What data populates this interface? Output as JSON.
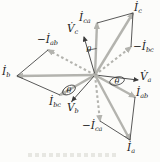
{
  "figure": {
    "type": "phasor-diagram",
    "canvas": {
      "width": 160,
      "height": 162
    },
    "colors": {
      "phasor_gray": "#b3b3ae",
      "construction_black": "#3b3b3b",
      "label_color": "#232323",
      "background": "#fcfcfa"
    },
    "center": [
      95,
      75
    ],
    "phasors": [
      {
        "name": "i-ca",
        "style": "thick",
        "tip": [
          97,
          23
        ]
      },
      {
        "name": "i-c",
        "style": "thick",
        "tip": [
          133,
          13
        ]
      },
      {
        "name": "neg-i-bc",
        "style": "dashed",
        "tip": [
          131,
          47
        ]
      },
      {
        "name": "v-c",
        "style": "thin",
        "tip": [
          84,
          37
        ]
      },
      {
        "name": "neg-i-ab",
        "style": "dashed",
        "tip": [
          48,
          50
        ]
      },
      {
        "name": "i-b",
        "style": "thick",
        "tip": [
          17,
          76
        ]
      },
      {
        "name": "i-bc",
        "style": "thick",
        "tip": [
          60,
          95
        ]
      },
      {
        "name": "v-b",
        "style": "thin",
        "tip": [
          72,
          101
        ]
      },
      {
        "name": "v-a",
        "style": "thin",
        "tip": [
          138,
          80
        ]
      },
      {
        "name": "i-ab",
        "style": "thick",
        "tip": [
          135,
          97
        ]
      },
      {
        "name": "i-a",
        "style": "thick",
        "tip": [
          130,
          140
        ]
      },
      {
        "name": "neg-i-ca",
        "style": "dashed",
        "tip": [
          100,
          121
        ]
      }
    ],
    "construction_lines": [
      {
        "name": "line-ica-to-ic",
        "from": [
          97,
          23
        ],
        "to": [
          133,
          13
        ]
      },
      {
        "name": "line-ic-to-negibc",
        "from": [
          133,
          13
        ],
        "to": [
          131,
          47
        ]
      },
      {
        "name": "line-negiab-to-ib",
        "from": [
          48,
          50
        ],
        "to": [
          17,
          76
        ]
      },
      {
        "name": "line-ib-to-ibc",
        "from": [
          17,
          76
        ],
        "to": [
          60,
          95
        ]
      },
      {
        "name": "line-negica-to-ia",
        "from": [
          100,
          121
        ],
        "to": [
          130,
          140
        ]
      },
      {
        "name": "line-iab-to-ia",
        "from": [
          135,
          97
        ],
        "to": [
          130,
          140
        ]
      }
    ],
    "labels": [
      {
        "name": "i-c",
        "x": 134,
        "y": 11,
        "prefix": "",
        "letter": "İ",
        "sub": "c"
      },
      {
        "name": "i-ca",
        "x": 79,
        "y": 21,
        "prefix": "",
        "letter": "İ",
        "sub": "ca"
      },
      {
        "name": "v-c",
        "x": 67,
        "y": 32,
        "prefix": "",
        "letter": "V̇",
        "sub": "c"
      },
      {
        "name": "neg-i-bc",
        "x": 133,
        "y": 50,
        "prefix": "−",
        "letter": "İ",
        "sub": "bc"
      },
      {
        "name": "neg-i-ab",
        "x": 37,
        "y": 43,
        "prefix": "−",
        "letter": "İ",
        "sub": "ab"
      },
      {
        "name": "i-b",
        "x": 2,
        "y": 75,
        "prefix": "",
        "letter": "İ",
        "sub": "b"
      },
      {
        "name": "i-bc",
        "x": 49,
        "y": 105,
        "prefix": "",
        "letter": "İ",
        "sub": "bc"
      },
      {
        "name": "v-b",
        "x": 67,
        "y": 111,
        "prefix": "",
        "letter": "V̇",
        "sub": "b"
      },
      {
        "name": "v-a",
        "x": 140,
        "y": 80,
        "prefix": "",
        "letter": "V̇",
        "sub": "a"
      },
      {
        "name": "i-ab",
        "x": 136,
        "y": 96,
        "prefix": "",
        "letter": "İ",
        "sub": "ab"
      },
      {
        "name": "neg-i-ca",
        "x": 82,
        "y": 129,
        "prefix": "−",
        "letter": "İ",
        "sub": "ca"
      },
      {
        "name": "i-a",
        "x": 127,
        "y": 151,
        "prefix": "",
        "letter": "İ",
        "sub": "a"
      }
    ],
    "angle_marks": [
      {
        "name": "theta-c",
        "text": "θ",
        "x": 89,
        "y": 52,
        "style": "arc",
        "arc_path": "M 86.5 51.5 A 27 27 0 0 1 96.5 48.5"
      },
      {
        "name": "theta-b",
        "text": "θ",
        "x": 69,
        "y": 93,
        "style": "ellipse",
        "cx": 69,
        "cy": 90,
        "rx": 7,
        "ry": 4,
        "rot": -30
      },
      {
        "name": "theta-a",
        "text": "θ",
        "x": 117,
        "y": 84,
        "style": "ellipse",
        "cx": 117,
        "cy": 81,
        "rx": 7.5,
        "ry": 4,
        "rot": -14
      }
    ]
  }
}
